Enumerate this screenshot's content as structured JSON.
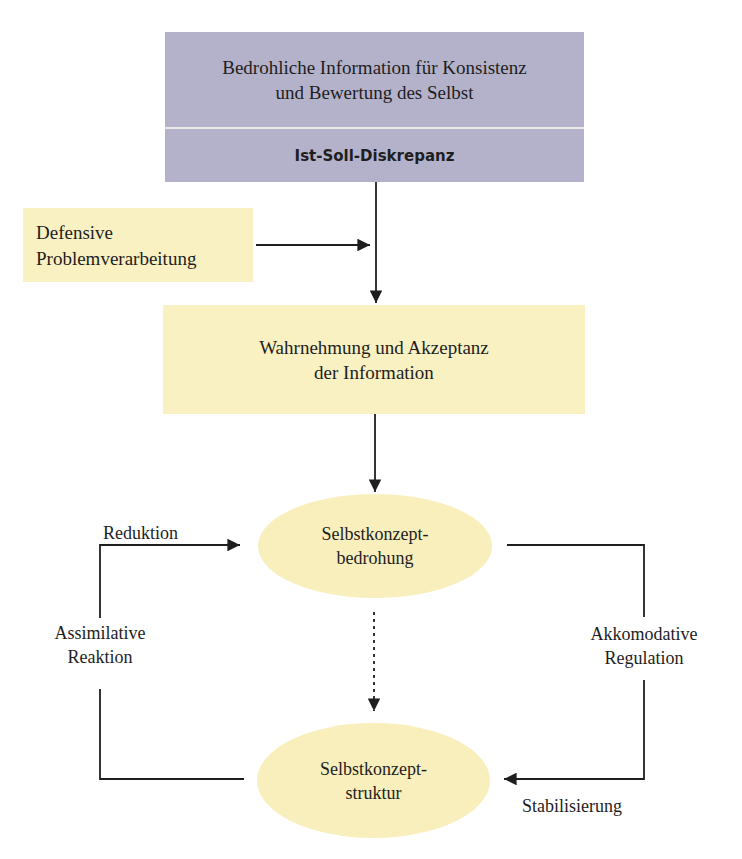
{
  "nodes": {
    "threat_info": {
      "line1": "Bedrohliche Information für Konsistenz",
      "line2": "und Bewertung des Selbst",
      "subtitle": "Ist-Soll-Diskrepanz"
    },
    "defensive": {
      "line1": "Defensive",
      "line2": "Problemverarbeitung"
    },
    "perception": {
      "line1": "Wahrnehmung und Akzeptanz",
      "line2": "der Information"
    },
    "threat": {
      "line1": "Selbstkonzept-",
      "line2": "bedrohung"
    },
    "structure": {
      "line1": "Selbstkonzept-",
      "line2": "struktur"
    }
  },
  "edge_labels": {
    "reduktion": "Reduktion",
    "assimilative_line1": "Assimilative",
    "assimilative_line2": "Reaktion",
    "akkomodative_line1": "Akkomodative",
    "akkomodative_line2": "Regulation",
    "stabilisierung": "Stabilisierung"
  },
  "colors": {
    "purple_box": "#b4b2ca",
    "yellow_box": "#f9f1c2",
    "ellipse": "#f8efbc",
    "line": "#1e1e1e"
  }
}
